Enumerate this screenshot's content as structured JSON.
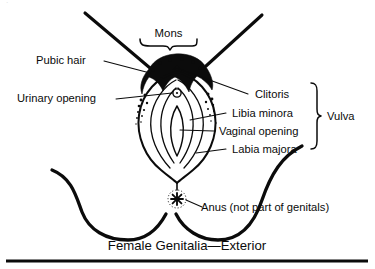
{
  "figure": {
    "caption": "Female Genitalia—Exterior",
    "top_label": {
      "text": "Mons",
      "name": "mons"
    },
    "group_label": {
      "text": "Vulva",
      "name": "vulva"
    },
    "labels_left": [
      {
        "text": "Pubic hair",
        "name": "pubic-hair"
      },
      {
        "text": "Urinary opening",
        "name": "urinary-opening"
      }
    ],
    "labels_right": [
      {
        "text": "Clitoris",
        "name": "clitoris"
      },
      {
        "text": "Libia minora",
        "name": "libia-minora"
      },
      {
        "text": "Vaginal opening",
        "name": "vaginal-opening"
      },
      {
        "text": "Labia majora",
        "name": "labia-majora"
      }
    ],
    "labels_bottom": [
      {
        "text": "Anus (not part of genitals)",
        "name": "anus"
      }
    ],
    "colors": {
      "ink": "#0b0b0b",
      "background": "#ffffff"
    }
  }
}
